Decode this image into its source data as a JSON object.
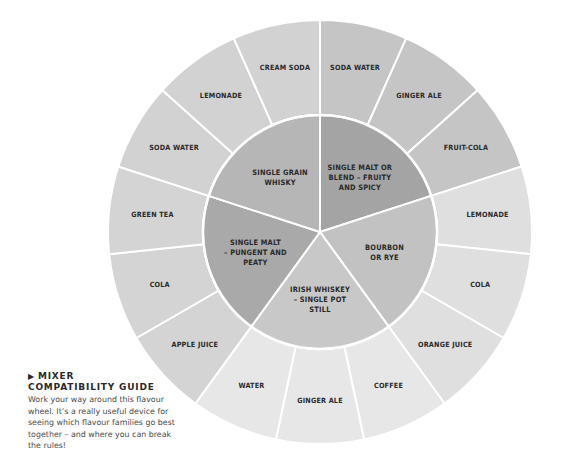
{
  "wheel": {
    "center": [
      320,
      232
    ],
    "outer_radius": 212,
    "inner_radius": 117,
    "start_angle_deg": 0,
    "inner_segments": [
      {
        "label": "SINGLE MALT OR BLEND – FRUITY AND SPICY",
        "lines": [
          "SINGLE MALT OR",
          "BLEND – FRUITY",
          "AND SPICY"
        ],
        "color": "#a4a4a4",
        "outer_color": "#c5c5c5",
        "mixers": [
          "SODA WATER",
          "GINGER ALE",
          "FRUIT-COLA"
        ]
      },
      {
        "label": "BOURBON OR RYE",
        "lines": [
          "BOURBON",
          "OR RYE"
        ],
        "color": "#c2c2c2",
        "outer_color": "#dfdfdf",
        "mixers": [
          "LEMONADE",
          "COLA",
          "ORANGE JUICE"
        ]
      },
      {
        "label": "IRISH WHISKEY – SINGLE POT STILL",
        "lines": [
          "IRISH WHISKEY",
          "– SINGLE POT",
          "STILL"
        ],
        "color": "#c8c8c8",
        "outer_color": "#e7e7e7",
        "mixers": [
          "COFFEE",
          "GINGER ALE",
          "WATER"
        ]
      },
      {
        "label": "SINGLE MALT – PUNGENT AND PEATY",
        "lines": [
          "SINGLE MALT",
          "– PUNGENT AND",
          "PEATY"
        ],
        "color": "#a9a9a9",
        "outer_color": "#d4d4d4",
        "mixers": [
          "APPLE JUICE",
          "COLA",
          "GREEN TEA"
        ]
      },
      {
        "label": "SINGLE GRAIN WHISKY",
        "lines": [
          "SINGLE GRAIN",
          "WHISKY"
        ],
        "color": "#b6b6b6",
        "outer_color": "#d2d2d2",
        "mixers": [
          "SODA WATER",
          "LEMONADE",
          "CREAM SODA"
        ]
      }
    ],
    "divider_color": "#ffffff"
  },
  "guide": {
    "arrow": "▶",
    "title_line1": "MIXER",
    "title_line2": "COMPATIBILITY GUIDE",
    "body": "Work your way around this flavour wheel.  It’s a really useful device for seeing which flavour families go best together – and where you can break the rules!"
  }
}
